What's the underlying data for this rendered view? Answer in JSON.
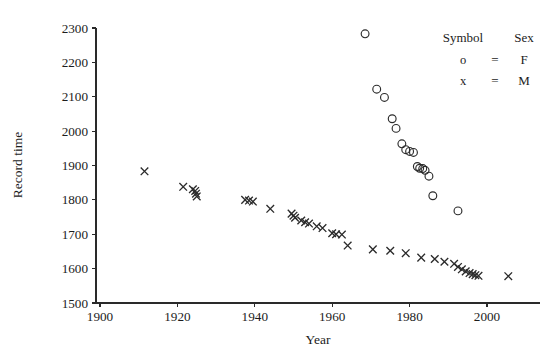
{
  "chart_data": {
    "type": "scatter",
    "title": "",
    "xlabel": "Year",
    "ylabel": "Record time",
    "xlim": [
      1896,
      2010
    ],
    "ylim": [
      1480,
      2320
    ],
    "xticks": [
      1900,
      1920,
      1940,
      1960,
      1980,
      2000
    ],
    "yticks": [
      1500,
      1600,
      1700,
      1800,
      1900,
      2000,
      2100,
      2200,
      2300
    ],
    "grid": false,
    "legend": {
      "position": "top-right",
      "header_symbol": "Symbol",
      "header_sex": "Sex",
      "rows": [
        {
          "symbol": "o",
          "equals": "=",
          "value": "F"
        },
        {
          "symbol": "x",
          "equals": "=",
          "value": "M"
        }
      ]
    },
    "series": [
      {
        "name": "F",
        "marker": "circle",
        "legend_label": "F",
        "color": "#2b2b2b",
        "points": [
          [
            1968.5,
            2283
          ],
          [
            1971.5,
            2122
          ],
          [
            1973.5,
            2098
          ],
          [
            1975.5,
            2036
          ],
          [
            1976.5,
            2008
          ],
          [
            1978.0,
            1963
          ],
          [
            1979.0,
            1946
          ],
          [
            1980.0,
            1941
          ],
          [
            1981.0,
            1938
          ],
          [
            1982.0,
            1897
          ],
          [
            1982.6,
            1892
          ],
          [
            1983.4,
            1891
          ],
          [
            1984.0,
            1886
          ],
          [
            1985.0,
            1869
          ],
          [
            1986.0,
            1812
          ],
          [
            1992.5,
            1768
          ]
        ]
      },
      {
        "name": "M",
        "marker": "cross",
        "legend_label": "M",
        "color": "#2b2b2b",
        "points": [
          [
            1911.5,
            1883
          ],
          [
            1921.5,
            1838
          ],
          [
            1924.0,
            1831
          ],
          [
            1924.6,
            1826
          ],
          [
            1924.8,
            1818
          ],
          [
            1925.0,
            1810
          ],
          [
            1937.5,
            1800
          ],
          [
            1938.5,
            1798
          ],
          [
            1939.5,
            1795
          ],
          [
            1944.0,
            1774
          ],
          [
            1949.5,
            1760
          ],
          [
            1950.0,
            1754
          ],
          [
            1950.4,
            1748
          ],
          [
            1952.0,
            1740
          ],
          [
            1953.0,
            1735
          ],
          [
            1954.0,
            1731
          ],
          [
            1956.0,
            1723
          ],
          [
            1957.5,
            1718
          ],
          [
            1960.0,
            1703
          ],
          [
            1961.0,
            1700
          ],
          [
            1962.5,
            1699
          ],
          [
            1964.0,
            1667
          ],
          [
            1970.5,
            1656
          ],
          [
            1975.0,
            1652
          ],
          [
            1979.0,
            1645
          ],
          [
            1983.0,
            1632
          ],
          [
            1986.5,
            1628
          ],
          [
            1989.0,
            1620
          ],
          [
            1991.5,
            1614
          ],
          [
            1992.5,
            1605
          ],
          [
            1993.5,
            1598
          ],
          [
            1994.5,
            1592
          ],
          [
            1995.5,
            1587
          ],
          [
            1996.3,
            1584
          ],
          [
            1997.0,
            1581
          ],
          [
            1997.8,
            1579
          ],
          [
            2005.5,
            1578
          ]
        ]
      }
    ]
  }
}
